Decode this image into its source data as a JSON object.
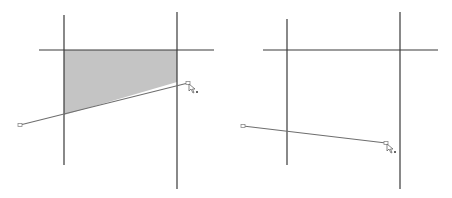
{
  "colors": {
    "background": "#ffffff",
    "line": "#3a3a3a",
    "segment": "#6e6e6e",
    "fill": "#c4c4c4",
    "handle": "#8a8a8a"
  },
  "panels": [
    {
      "name": "left",
      "vertical_lines": [
        {
          "x": 64,
          "y1": 15,
          "y2": 165
        },
        {
          "x": 177,
          "y1": 12,
          "y2": 189
        }
      ],
      "horizontal_lines": [
        {
          "y": 50,
          "x1": 39,
          "x2": 214
        }
      ],
      "shaded_region": "64,50 177,50 177,82 64,115",
      "segment": {
        "x1": 20,
        "y1": 125,
        "x2": 188,
        "y2": 83
      },
      "cursor": {
        "x": 188,
        "y": 83
      }
    },
    {
      "name": "right",
      "vertical_lines": [
        {
          "x": 287,
          "y1": 19,
          "y2": 165
        },
        {
          "x": 400,
          "y1": 12,
          "y2": 189
        }
      ],
      "horizontal_lines": [
        {
          "y": 50,
          "x1": 263,
          "x2": 438
        }
      ],
      "shaded_region": null,
      "segment": {
        "x1": 243,
        "y1": 126,
        "x2": 386,
        "y2": 143
      },
      "cursor": {
        "x": 386,
        "y": 143
      }
    }
  ]
}
